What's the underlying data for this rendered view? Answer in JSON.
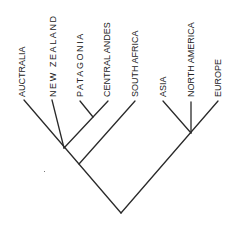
{
  "diagram": {
    "type": "cladogram",
    "line_color": "#2a2a2a",
    "taxa": [
      {
        "label": "AUCTRALIA",
        "tip": [
          24,
          100
        ],
        "label_x": 17,
        "label_bottom": 97,
        "wide": false
      },
      {
        "label": "NEW ZEALAND",
        "tip": [
          52,
          100
        ],
        "label_x": 48,
        "label_bottom": 97,
        "wide": true
      },
      {
        "label": "PATAGONIA",
        "tip": [
          80,
          101
        ],
        "label_x": 75,
        "label_bottom": 97,
        "wide": true
      },
      {
        "label": "CENTRAL ANDES",
        "tip": [
          108,
          101
        ],
        "label_x": 102,
        "label_bottom": 97,
        "wide": false
      },
      {
        "label": "SOUTH AFRICA",
        "tip": [
          135,
          101
        ],
        "label_x": 130,
        "label_bottom": 97,
        "wide": false
      },
      {
        "label": "ASIA",
        "tip": [
          163,
          101
        ],
        "label_x": 158,
        "label_bottom": 97,
        "wide": false
      },
      {
        "label": "NORTH AMERICA",
        "tip": [
          191,
          102
        ],
        "label_x": 186,
        "label_bottom": 97,
        "wide": false
      },
      {
        "label": "EUROPE",
        "tip": [
          218,
          101
        ],
        "label_x": 213,
        "label_bottom": 97,
        "wide": false
      }
    ],
    "nodes": {
      "root": [
        121,
        213
      ],
      "southern": [
        79,
        164
      ],
      "gondwana_core": [
        64,
        148
      ],
      "patagonia_andes": [
        93,
        117
      ],
      "holarctic": [
        191,
        133
      ]
    },
    "branches": [
      {
        "from": "root",
        "to": [
          24,
          100
        ]
      },
      {
        "from": "root",
        "to": [
          218,
          101
        ]
      },
      {
        "from": "southern",
        "to": [
          135,
          101
        ]
      },
      {
        "from": "gondwana_core",
        "to": [
          52,
          100
        ]
      },
      {
        "from": "gondwana_core",
        "to": [
          108,
          101
        ]
      },
      {
        "from": "patagonia_andes",
        "to": [
          80,
          101
        ]
      },
      {
        "from": "holarctic",
        "to": [
          163,
          101
        ]
      },
      {
        "from": "holarctic",
        "to": [
          191,
          102
        ]
      }
    ]
  }
}
